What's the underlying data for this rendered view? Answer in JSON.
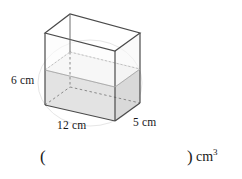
{
  "figure": {
    "type": "rectangular-prism-partially-filled",
    "dimensions": {
      "height_label": "6 cm",
      "length_label": "12 cm",
      "width_label": "5 cm"
    },
    "colors": {
      "edge": "#4a4a4a",
      "hidden_edge": "#7a7a7a",
      "water_fill": "#dcdcdc",
      "water_top": "#eaeaea",
      "guide_circle": "#e2e2e2",
      "background": "#ffffff"
    },
    "geometry": {
      "top_front_left": [
        45,
        33
      ],
      "top_back_left": [
        70,
        14
      ],
      "top_back_right": [
        140,
        33
      ],
      "top_front_right": [
        115,
        51
      ],
      "bottom_front_left": [
        45,
        105
      ],
      "bottom_back_left": [
        70,
        87
      ],
      "bottom_back_right": [
        140,
        103
      ],
      "bottom_front_right": [
        115,
        121
      ],
      "water_front_left": [
        45,
        70
      ],
      "water_back_left": [
        70,
        52
      ],
      "water_back_right": [
        140,
        69
      ],
      "water_front_right": [
        115,
        87
      ]
    }
  },
  "answer": {
    "open_paren": "(",
    "close_paren": ")",
    "unit_base": "cm",
    "unit_exponent": "3",
    "value": ""
  }
}
